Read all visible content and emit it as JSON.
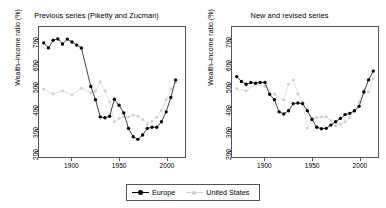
{
  "figure": {
    "width": 386,
    "height": 208,
    "background": "#ffffff"
  },
  "legend": {
    "position": "bottom-center",
    "entries": [
      {
        "label": "Europe",
        "color": "#000000",
        "marker": "filled-circle"
      },
      {
        "label": "United States",
        "color": "#d0d0d0",
        "marker": "filled-circle"
      }
    ]
  },
  "axes_common": {
    "ylabel": "Wealth–income ratio (%)",
    "yticks": [
      200,
      300,
      400,
      500,
      600,
      700
    ],
    "ylim": [
      170,
      760
    ],
    "xticks": [
      1900,
      1950,
      2000
    ],
    "xlim": [
      1865,
      2020
    ],
    "grid": false
  },
  "chart_data": [
    {
      "type": "line",
      "title": "Previous series (Piketty and Zucman)",
      "xlabel": "",
      "ylabel": "Wealth–income ratio (%)",
      "xlim": [
        1865,
        2020
      ],
      "ylim": [
        170,
        760
      ],
      "xticks": [
        1900,
        1950,
        2000
      ],
      "yticks": [
        200,
        300,
        400,
        500,
        600,
        700
      ],
      "grid": false,
      "legend": "bottom-center",
      "series": [
        {
          "name": "Europe",
          "color": "#000000",
          "marker": "filled-circle",
          "x": [
            1870,
            1875,
            1880,
            1885,
            1890,
            1895,
            1900,
            1905,
            1910,
            1920,
            1925,
            1930,
            1935,
            1940,
            1945,
            1950,
            1955,
            1960,
            1965,
            1970,
            1975,
            1980,
            1985,
            1990,
            1995,
            2000,
            2005,
            2010
          ],
          "y": [
            688,
            665,
            700,
            706,
            683,
            705,
            692,
            678,
            665,
            490,
            430,
            352,
            348,
            355,
            432,
            405,
            370,
            300,
            262,
            250,
            270,
            300,
            305,
            305,
            330,
            375,
            440,
            520
          ]
        },
        {
          "name": "United States",
          "color": "#d0d0d0",
          "marker": "filled-circle",
          "x": [
            1870,
            1880,
            1890,
            1900,
            1910,
            1920,
            1925,
            1930,
            1935,
            1940,
            1945,
            1950,
            1955,
            1960,
            1965,
            1970,
            1975,
            1980,
            1985,
            1990,
            1995,
            2000,
            2005,
            2010
          ],
          "y": [
            478,
            456,
            470,
            452,
            482,
            460,
            468,
            510,
            470,
            420,
            330,
            345,
            352,
            352,
            360,
            355,
            340,
            320,
            330,
            350,
            380,
            430,
            478,
            508
          ]
        }
      ]
    },
    {
      "type": "line",
      "title": "New and revised series",
      "xlabel": "",
      "ylabel": "Wealth–income ratio (%)",
      "xlim": [
        1865,
        2020
      ],
      "ylim": [
        170,
        760
      ],
      "xticks": [
        1900,
        1950,
        2000
      ],
      "yticks": [
        200,
        300,
        400,
        500,
        600,
        700
      ],
      "grid": false,
      "legend": "bottom-center",
      "series": [
        {
          "name": "Europe",
          "color": "#000000",
          "marker": "filled-circle",
          "x": [
            1870,
            1875,
            1880,
            1885,
            1890,
            1895,
            1900,
            1905,
            1910,
            1915,
            1920,
            1925,
            1930,
            1935,
            1940,
            1945,
            1950,
            1955,
            1960,
            1965,
            1970,
            1975,
            1980,
            1985,
            1990,
            1995,
            2000,
            2005,
            2010,
            2015
          ],
          "y": [
            535,
            513,
            500,
            508,
            505,
            508,
            508,
            455,
            430,
            375,
            365,
            380,
            412,
            415,
            412,
            380,
            340,
            305,
            298,
            300,
            315,
            330,
            345,
            362,
            368,
            380,
            400,
            465,
            520,
            560
          ]
        },
        {
          "name": "United States",
          "color": "#d0d0d0",
          "marker": "filled-circle",
          "x": [
            1870,
            1880,
            1890,
            1900,
            1910,
            1920,
            1925,
            1930,
            1935,
            1940,
            1945,
            1950,
            1955,
            1960,
            1965,
            1970,
            1975,
            1980,
            1985,
            1990,
            1995,
            2000,
            2005,
            2010,
            2015
          ],
          "y": [
            480,
            470,
            500,
            490,
            455,
            430,
            500,
            520,
            455,
            420,
            300,
            345,
            348,
            352,
            352,
            335,
            312,
            318,
            330,
            348,
            375,
            420,
            475,
            465,
            525
          ]
        }
      ]
    }
  ]
}
